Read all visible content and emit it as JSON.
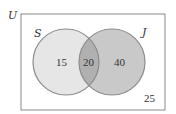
{
  "diagram": {
    "type": "venn",
    "universe_label": "U",
    "sets": [
      {
        "label": "S",
        "only_count": "15",
        "fill": "#e6e6e6"
      },
      {
        "label": "J",
        "only_count": "40",
        "fill": "#c9c9c9"
      }
    ],
    "intersection_count": "20",
    "outside_count": "25",
    "colors": {
      "border": "#8a8a8a",
      "circle_stroke": "#8c8c8c",
      "intersection_fill": "#b3b3b3",
      "background": "#ffffff"
    }
  }
}
